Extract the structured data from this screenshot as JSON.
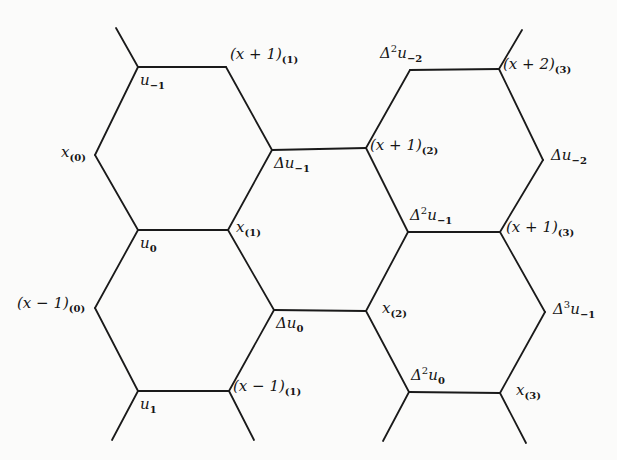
{
  "figure": {
    "type": "hexagonal-lattice",
    "stroke_color": "#1a1a1a",
    "background": "#fbfbfa"
  },
  "vertices": [
    {
      "id": "u_m1",
      "x": 138,
      "y": 67,
      "label": {
        "base": "u",
        "sup": "",
        "sub": "−1",
        "dx": 2,
        "dy": 6
      }
    },
    {
      "id": "xp1_1",
      "x": 226,
      "y": 67,
      "label": {
        "base": "(x + 1)",
        "sup": "",
        "sub": "(1)",
        "dx": 4,
        "dy": -20
      }
    },
    {
      "id": "x_0",
      "x": 95,
      "y": 155,
      "label": {
        "base": "x",
        "sup": "",
        "sub": "(0)",
        "dx": -34,
        "dy": -10
      }
    },
    {
      "id": "du_m1",
      "x": 272,
      "y": 150,
      "label": {
        "base": "Δu",
        "sup": "",
        "sub": "−1",
        "dx": 2,
        "dy": 6
      }
    },
    {
      "id": "xp1_2",
      "x": 366,
      "y": 148,
      "label": {
        "base": "(x + 1)",
        "sup": "",
        "sub": "(2)",
        "dx": 4,
        "dy": -10
      }
    },
    {
      "id": "d2u_m2",
      "x": 410,
      "y": 70,
      "label": {
        "base": "Δ",
        "sup": "2",
        "sub": "−2",
        "u": true,
        "dx": -30,
        "dy": -26
      }
    },
    {
      "id": "xp2_3",
      "x": 499,
      "y": 69,
      "label": {
        "base": "(x + 2)",
        "sup": "",
        "sub": "(3)",
        "dx": 4,
        "dy": -12
      }
    },
    {
      "id": "du_m2",
      "x": 543,
      "y": 160,
      "label": {
        "base": "Δu",
        "sup": "",
        "sub": "−2",
        "dx": 8,
        "dy": -12
      }
    },
    {
      "id": "u_0",
      "x": 138,
      "y": 230,
      "label": {
        "base": "u",
        "sup": "",
        "sub": "0",
        "dx": 2,
        "dy": 6
      }
    },
    {
      "id": "x_1",
      "x": 228,
      "y": 230,
      "label": {
        "base": "x",
        "sup": "",
        "sub": "(1)",
        "dx": 8,
        "dy": -10
      }
    },
    {
      "id": "d2u_m1",
      "x": 408,
      "y": 232,
      "label": {
        "base": "Δ",
        "sup": "2",
        "sub": "−1",
        "u": true,
        "dx": 2,
        "dy": -26
      }
    },
    {
      "id": "xp1_3",
      "x": 500,
      "y": 232,
      "label": {
        "base": "(x + 1)",
        "sup": "",
        "sub": "(3)",
        "dx": 6,
        "dy": -12
      }
    },
    {
      "id": "xm1_0",
      "x": 95,
      "y": 308,
      "label": {
        "base": "(x − 1)",
        "sup": "",
        "sub": "(0)",
        "dx": -78,
        "dy": -12
      }
    },
    {
      "id": "du_0",
      "x": 274,
      "y": 310,
      "label": {
        "base": "Δu",
        "sup": "",
        "sub": "0",
        "dx": 2,
        "dy": 6
      }
    },
    {
      "id": "x_2",
      "x": 366,
      "y": 311,
      "label": {
        "base": "x",
        "sup": "",
        "sub": "(2)",
        "dx": 16,
        "dy": -10
      }
    },
    {
      "id": "d3u_m1",
      "x": 545,
      "y": 312,
      "label": {
        "base": "Δ",
        "sup": "3",
        "sub": "−1",
        "u": true,
        "dx": 8,
        "dy": -12
      }
    },
    {
      "id": "u_1",
      "x": 138,
      "y": 391,
      "label": {
        "base": "u",
        "sup": "",
        "sub": "1",
        "dx": 2,
        "dy": 6
      }
    },
    {
      "id": "xm1_1",
      "x": 229,
      "y": 391,
      "label": {
        "base": "(x − 1)",
        "sup": "",
        "sub": "(1)",
        "dx": 4,
        "dy": -12
      }
    },
    {
      "id": "d2u_0",
      "x": 409,
      "y": 392,
      "label": {
        "base": "Δ",
        "sup": "2",
        "sub": "0",
        "u": true,
        "dx": 2,
        "dy": -26
      }
    },
    {
      "id": "x_3",
      "x": 500,
      "y": 393,
      "label": {
        "base": "x",
        "sup": "",
        "sub": "(3)",
        "dx": 16,
        "dy": -10
      }
    }
  ],
  "edges": [
    [
      "u_m1",
      "xp1_1"
    ],
    [
      "u_m1",
      "x_0"
    ],
    [
      "xp1_1",
      "du_m1"
    ],
    [
      "x_0",
      "u_0"
    ],
    [
      "du_m1",
      "x_1"
    ],
    [
      "du_m1",
      "xp1_2"
    ],
    [
      "u_0",
      "x_1"
    ],
    [
      "u_0",
      "xm1_0"
    ],
    [
      "x_1",
      "du_0"
    ],
    [
      "xm1_0",
      "u_1"
    ],
    [
      "du_0",
      "xm1_1"
    ],
    [
      "du_0",
      "x_2"
    ],
    [
      "u_1",
      "xm1_1"
    ],
    [
      "xp1_2",
      "d2u_m2"
    ],
    [
      "d2u_m2",
      "xp2_3"
    ],
    [
      "xp2_3",
      "du_m2"
    ],
    [
      "xp1_2",
      "d2u_m1"
    ],
    [
      "du_m2",
      "xp1_3"
    ],
    [
      "d2u_m1",
      "xp1_3"
    ],
    [
      "d2u_m1",
      "x_2"
    ],
    [
      "xp1_3",
      "d3u_m1"
    ],
    [
      "x_2",
      "d2u_0"
    ],
    [
      "d3u_m1",
      "x_3"
    ],
    [
      "d2u_0",
      "x_3"
    ]
  ],
  "stubs": [
    [
      [
        138,
        67
      ],
      [
        116,
        28
      ]
    ],
    [
      [
        499,
        69
      ],
      [
        522,
        30
      ]
    ],
    [
      [
        138,
        391
      ],
      [
        112,
        440
      ]
    ],
    [
      [
        229,
        391
      ],
      [
        254,
        440
      ]
    ],
    [
      [
        409,
        392
      ],
      [
        383,
        441
      ]
    ],
    [
      [
        500,
        393
      ],
      [
        526,
        443
      ]
    ]
  ]
}
